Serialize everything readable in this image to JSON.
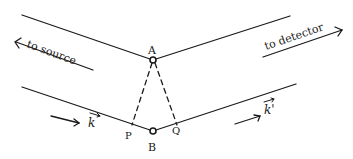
{
  "diagram": {
    "type": "bragg-reflection-sketch",
    "labels": {
      "to_source": "to source",
      "to_detector": "to detector",
      "point_a": "A",
      "point_b": "B",
      "point_p": "P",
      "point_q": "Q",
      "incident_wavevector": "k",
      "scattered_wavevector": "k'"
    },
    "colors": {
      "ink": "#1a1a1a",
      "background": "#ffffff"
    }
  }
}
